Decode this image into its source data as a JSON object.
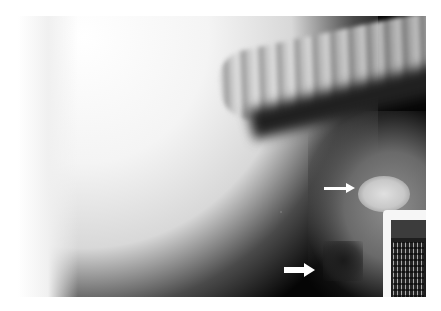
{
  "image": {
    "description": "Lateral thoracic/abdominal radiograph with two white arrows",
    "annotations": [
      {
        "type": "arrow",
        "name": "upper-arrow",
        "points_to": "radiopaque mass"
      },
      {
        "type": "arrow",
        "name": "lower-arrow",
        "points_to": "gas-filled structure"
      }
    ],
    "label": {
      "present": true,
      "text": ""
    }
  },
  "colors": {
    "background": "#ffffff",
    "film_dark": "#050505",
    "soft_tissue": "#f4f4f4",
    "arrow": "#ffffff"
  }
}
